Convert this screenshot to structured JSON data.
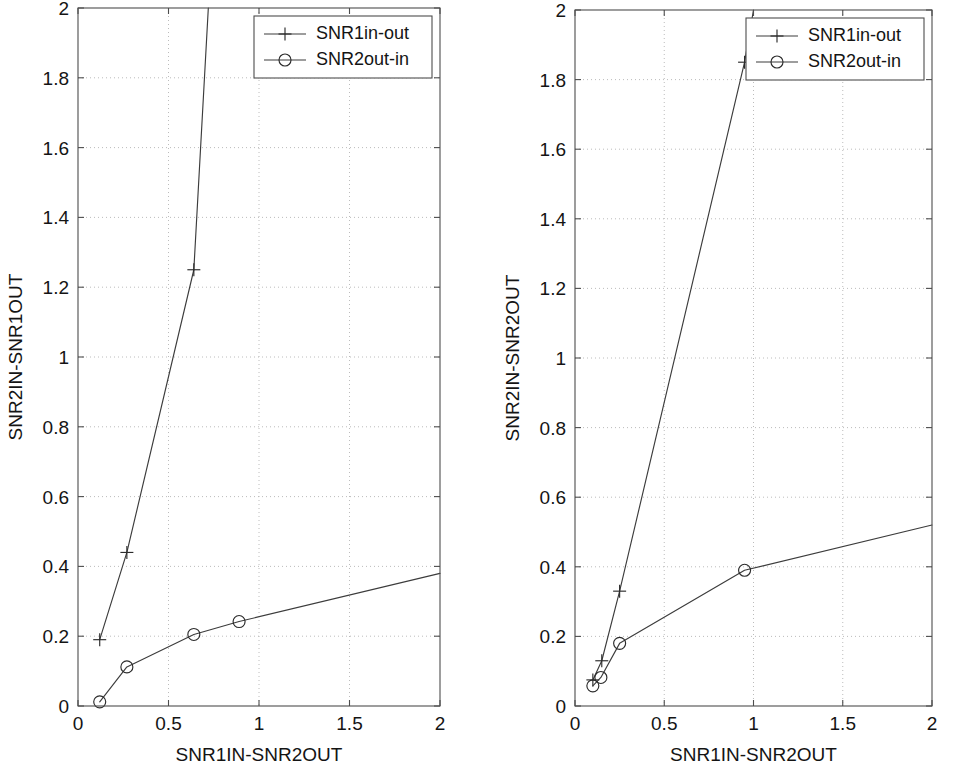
{
  "figure": {
    "panel_count": 2,
    "background_color": "#ffffff",
    "line_color": "#3c3c3c",
    "grid_color": "#b4b4b4",
    "axis_color": "#4d4d4d"
  },
  "legend": {
    "entries": [
      {
        "label": "SNR1in-out",
        "marker": "plus-icon"
      },
      {
        "label": "SNR2out-in",
        "marker": "circle-icon"
      }
    ],
    "position": "top-right"
  },
  "chart_data": [
    {
      "type": "line",
      "panel": "left",
      "title": "",
      "xlabel": "SNR1IN-SNR2OUT",
      "ylabel": "SNR2IN-SNR1OUT",
      "xlim": [
        0,
        2
      ],
      "ylim": [
        0,
        2
      ],
      "xticks": [
        0,
        0.5,
        1,
        1.5,
        2
      ],
      "xticklabels": [
        "0",
        "0.5",
        "1",
        "1.5",
        "2"
      ],
      "yticks": [
        0,
        0.2,
        0.4,
        0.6,
        0.8,
        1,
        1.2,
        1.4,
        1.6,
        1.8,
        2
      ],
      "yticklabels": [
        "0",
        "0.2",
        "0.4",
        "0.6",
        "0.8",
        "1",
        "1.2",
        "1.4",
        "1.6",
        "1.8",
        "2"
      ],
      "grid": true,
      "legend": true,
      "series": [
        {
          "name": "SNR1in-out",
          "marker": "plus",
          "x": [
            0.12,
            0.27,
            0.64,
            0.72
          ],
          "y": [
            0.19,
            0.44,
            1.25,
            2.0
          ],
          "marker_x": [
            0.12,
            0.27,
            0.64
          ],
          "marker_y": [
            0.19,
            0.44,
            1.25
          ]
        },
        {
          "name": "SNR2out-in",
          "marker": "circle",
          "x": [
            0.12,
            0.27,
            0.64,
            0.89,
            2.0
          ],
          "y": [
            0.012,
            0.112,
            0.205,
            0.242,
            0.38
          ],
          "marker_x": [
            0.12,
            0.27,
            0.64,
            0.89
          ],
          "marker_y": [
            0.012,
            0.112,
            0.205,
            0.242
          ]
        }
      ]
    },
    {
      "type": "line",
      "panel": "right",
      "title": "",
      "xlabel": "SNR1IN-SNR2OUT",
      "ylabel": "SNR2IN-SNR2OUT",
      "xlim": [
        0,
        2
      ],
      "ylim": [
        0,
        2
      ],
      "xticks": [
        0,
        0.5,
        1,
        1.5,
        2
      ],
      "xticklabels": [
        "0",
        "0.5",
        "1",
        "1.5",
        "2"
      ],
      "yticks": [
        0,
        0.2,
        0.4,
        0.6,
        0.8,
        1,
        1.2,
        1.4,
        1.6,
        1.8,
        2
      ],
      "yticklabels": [
        "0",
        "0.2",
        "0.4",
        "0.6",
        "0.8",
        "1",
        "1.2",
        "1.4",
        "1.6",
        "1.8",
        "2"
      ],
      "grid": true,
      "legend": true,
      "series": [
        {
          "name": "SNR1in-out",
          "marker": "plus",
          "x": [
            0.1,
            0.15,
            0.25,
            0.95,
            1.0
          ],
          "y": [
            0.075,
            0.13,
            0.33,
            1.85,
            2.0
          ],
          "marker_x": [
            0.1,
            0.15,
            0.25,
            0.95
          ],
          "marker_y": [
            0.075,
            0.13,
            0.33,
            1.85
          ]
        },
        {
          "name": "SNR2out-in",
          "marker": "circle",
          "x": [
            0.1,
            0.145,
            0.25,
            0.95,
            2.0
          ],
          "y": [
            0.058,
            0.082,
            0.18,
            0.39,
            0.52
          ],
          "marker_x": [
            0.1,
            0.145,
            0.25,
            0.95
          ],
          "marker_y": [
            0.058,
            0.082,
            0.18,
            0.39
          ]
        }
      ]
    }
  ]
}
